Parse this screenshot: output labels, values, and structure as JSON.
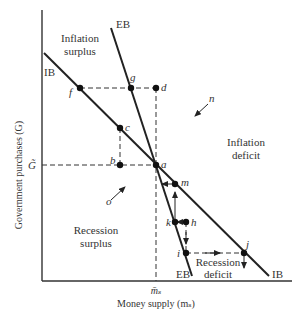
{
  "axes": {
    "y_label": "Government purchases (G)",
    "x_label": "Money supply (mₛ)",
    "y_tick": "G̃",
    "x_tick": "m̄ₛ"
  },
  "curves": {
    "ib_label": "IB",
    "eb_label": "EB"
  },
  "regions": {
    "inflation_surplus": [
      "Inflation",
      "surplus"
    ],
    "inflation_deficit": [
      "Inflation",
      "deficit"
    ],
    "recession_surplus": [
      "Recession",
      "surplus"
    ],
    "recession_deficit": [
      "Recession",
      "deficit"
    ]
  },
  "points": {
    "a": "a",
    "b": "b",
    "c": "c",
    "d": "d",
    "f": "f",
    "g": "g",
    "h": "h",
    "i": "i",
    "j": "j",
    "k": "k",
    "m": "m"
  },
  "arrows": {
    "n": "n",
    "o": "o"
  }
}
